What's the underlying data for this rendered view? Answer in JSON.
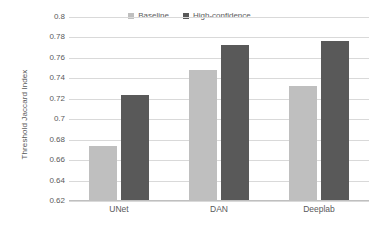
{
  "chart_data": {
    "type": "bar",
    "title": "",
    "subtitle": "",
    "xlabel": "",
    "ylabel": "Threshold Jaccard Index",
    "categories": [
      "UNet",
      "DAN",
      "Deeplab"
    ],
    "series": [
      {
        "name": "Baseline",
        "color": "#bfbfbf",
        "values": [
          0.674,
          0.748,
          0.733
        ]
      },
      {
        "name": "High-confidence",
        "color": "#595959",
        "values": [
          0.724,
          0.773,
          0.777
        ]
      }
    ],
    "ylim": [
      0.62,
      0.8
    ],
    "ytick_step": 0.02,
    "yticks": [
      0.8,
      0.78,
      0.76,
      0.74,
      0.72,
      0.7,
      0.68,
      0.66,
      0.64,
      0.62
    ],
    "ytick_labels": [
      "0.8",
      "0.78",
      "0.76",
      "0.74",
      "0.72",
      "0.7",
      "0.68",
      "0.66",
      "0.64",
      "0.62"
    ],
    "grid": true,
    "grid_axis": "y",
    "legend_position": "top-center",
    "background": "#ffffff",
    "grid_color": "#d9d9d9",
    "text_color": "#59595b"
  },
  "legend": {
    "entries": [
      {
        "label": "Baseline",
        "color": "#bfbfbf"
      },
      {
        "label": "High-confidence",
        "color": "#595959"
      }
    ]
  }
}
